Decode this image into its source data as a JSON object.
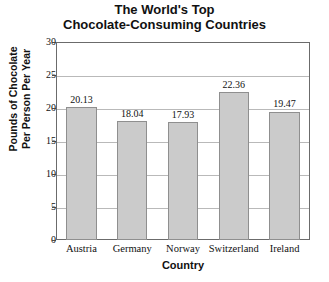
{
  "chart_data": {
    "type": "bar",
    "title": "The World's Top Chocolate-Consuming Countries",
    "title_line1": "The World's Top",
    "title_line2": "Chocolate-Consuming Countries",
    "xlabel": "Country",
    "ylabel": "Pounds of Chocolate Per Person Per Year",
    "ylabel_line1": "Pounds of Chocolate",
    "ylabel_line2": "Per Person Per Year",
    "categories": [
      "Austria",
      "Germany",
      "Norway",
      "Switzerland",
      "Ireland"
    ],
    "values": [
      20.13,
      18.04,
      17.93,
      22.36,
      19.47
    ],
    "value_labels": [
      "20.13",
      "18.04",
      "17.93",
      "22.36",
      "19.47"
    ],
    "ylim": [
      0,
      30
    ],
    "ytick_labels": [
      "0",
      "5",
      "10",
      "15",
      "20",
      "25",
      "30"
    ],
    "ytick_values": [
      0,
      5,
      10,
      15,
      20,
      25,
      30
    ],
    "grid": "horizontal",
    "legend": "none",
    "bar_fill_color": "#cbcbcb",
    "bar_border_color": "#8f8f8f",
    "gridline_color": "#b9b9b9",
    "frame_color": "#6b6b6b",
    "text_color": "#111111",
    "background_color": "#ffffff"
  }
}
